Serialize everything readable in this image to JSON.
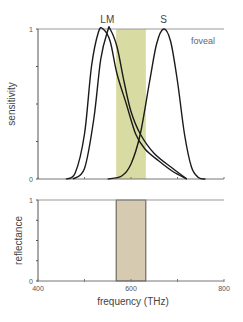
{
  "chart_data": [
    {
      "type": "line",
      "panel": "top",
      "ylabel": "sensitivity",
      "xlabel": "",
      "xlim": [
        400,
        800
      ],
      "ylim": [
        0,
        1
      ],
      "y_ticks": [
        0,
        0.25,
        0.5,
        0.75,
        1
      ],
      "y_tick_labels": [
        "0",
        "",
        "",
        "",
        "1"
      ],
      "x_ticks": [
        400,
        500,
        600,
        700,
        800
      ],
      "annotation": "foveal",
      "highlight_band": {
        "x_start": 568,
        "x_end": 632,
        "color": "#d9dca2"
      },
      "series": [
        {
          "name": "L",
          "peak": 540,
          "points": [
            [
              460,
              0
            ],
            [
              480,
              0.04
            ],
            [
              500,
              0.3
            ],
            [
              515,
              0.75
            ],
            [
              530,
              0.98
            ],
            [
              540,
              1
            ],
            [
              555,
              0.92
            ],
            [
              570,
              0.7
            ],
            [
              590,
              0.5
            ],
            [
              610,
              0.3
            ],
            [
              630,
              0.2
            ],
            [
              660,
              0.12
            ],
            [
              690,
              0.05
            ],
            [
              720,
              0
            ]
          ]
        },
        {
          "name": "M",
          "peak": 555,
          "points": [
            [
              475,
              0
            ],
            [
              500,
              0.07
            ],
            [
              520,
              0.4
            ],
            [
              535,
              0.8
            ],
            [
              550,
              0.99
            ],
            [
              555,
              1
            ],
            [
              570,
              0.88
            ],
            [
              585,
              0.65
            ],
            [
              600,
              0.45
            ],
            [
              620,
              0.3
            ],
            [
              650,
              0.17
            ],
            [
              690,
              0.07
            ],
            [
              720,
              0
            ]
          ]
        },
        {
          "name": "S",
          "peak": 670,
          "points": [
            [
              550,
              0
            ],
            [
              580,
              0.02
            ],
            [
              600,
              0.1
            ],
            [
              620,
              0.3
            ],
            [
              640,
              0.65
            ],
            [
              655,
              0.9
            ],
            [
              670,
              1
            ],
            [
              685,
              0.92
            ],
            [
              700,
              0.65
            ],
            [
              715,
              0.3
            ],
            [
              730,
              0.08
            ],
            [
              745,
              0.01
            ],
            [
              760,
              0
            ]
          ]
        }
      ]
    },
    {
      "type": "bar",
      "panel": "bottom",
      "ylabel": "reflectance",
      "xlabel": "frequency (THz)",
      "xlim": [
        400,
        800
      ],
      "ylim": [
        0,
        1
      ],
      "y_tick_labels": [
        "0",
        "",
        "",
        "",
        "1"
      ],
      "x_ticks": [
        400,
        500,
        600,
        700,
        800
      ],
      "x_tick_labels": [
        "400",
        "",
        "600",
        "",
        "800"
      ],
      "bar": {
        "x_start": 568,
        "x_end": 632,
        "value": 1,
        "color": "#d6cbb0"
      }
    }
  ]
}
